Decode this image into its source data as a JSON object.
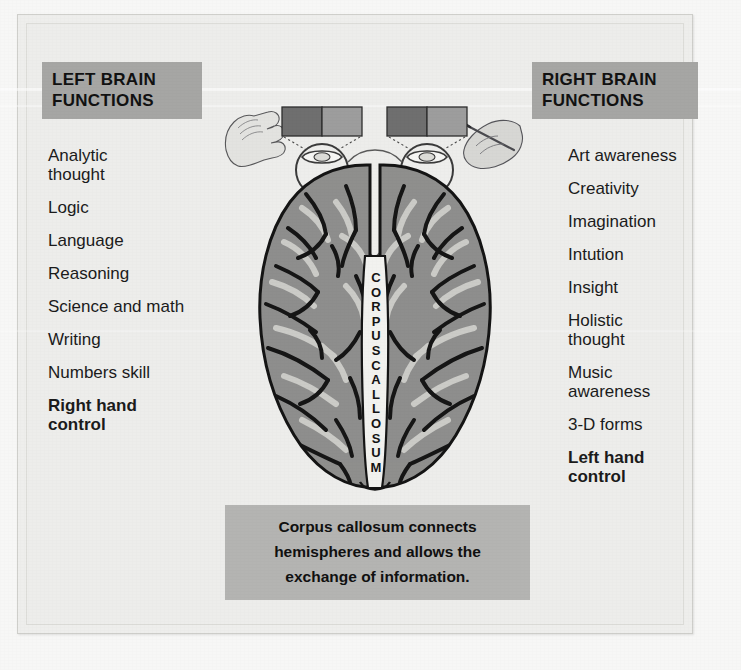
{
  "figure": {
    "background_color": "#ededeb",
    "header_box_color": "#a6a6a4",
    "caption_box_color": "#b4b4b2",
    "brain_fill_color": "#8f8f8d",
    "brain_outline_color": "#1a1a1a",
    "gyri_highlight_color": "#d9d9d6"
  },
  "left_column": {
    "header": "LEFT BRAIN\nFUNCTIONS",
    "items": [
      {
        "label": "Analytic\nthought",
        "bold": false
      },
      {
        "label": "Logic",
        "bold": false
      },
      {
        "label": "Language",
        "bold": false
      },
      {
        "label": "Reasoning",
        "bold": false
      },
      {
        "label": "Science and math",
        "bold": false
      },
      {
        "label": "Writing",
        "bold": false
      },
      {
        "label": "Numbers skill",
        "bold": false
      },
      {
        "label": "Right hand\ncontrol",
        "bold": true
      }
    ]
  },
  "right_column": {
    "header": "RIGHT BRAIN\nFUNCTIONS",
    "items": [
      {
        "label": "Art awareness",
        "bold": false
      },
      {
        "label": "Creativity",
        "bold": false
      },
      {
        "label": "Imagination",
        "bold": false
      },
      {
        "label": "Intution",
        "bold": false
      },
      {
        "label": "Insight",
        "bold": false
      },
      {
        "label": "Holistic\nthought",
        "bold": false
      },
      {
        "label": "Music\nawareness",
        "bold": false
      },
      {
        "label": "3-D forms",
        "bold": false
      },
      {
        "label": "Left hand\ncontrol",
        "bold": true
      }
    ]
  },
  "diagram": {
    "corpus_callosum_label": "CORPUS CALLOSUM",
    "left_eye_label": "left-eye",
    "right_eye_label": "right-eye",
    "left_hand_label": "open-hand",
    "right_hand_label": "hand-holding-pen",
    "visual_field_bars": [
      {
        "name": "left-visual-field-bar",
        "dark_half": "left",
        "dark_color": "#6f6f6f",
        "light_color": "#9d9d9d"
      },
      {
        "name": "right-visual-field-bar",
        "dark_half": "left",
        "dark_color": "#6f6f6f",
        "light_color": "#9d9d9d"
      }
    ]
  },
  "caption": {
    "lines": [
      "Corpus callosum connects",
      "hemispheres and allows the",
      "exchange of information."
    ],
    "text": "Corpus callosum connects hemispheres and allows the exchange of information."
  }
}
